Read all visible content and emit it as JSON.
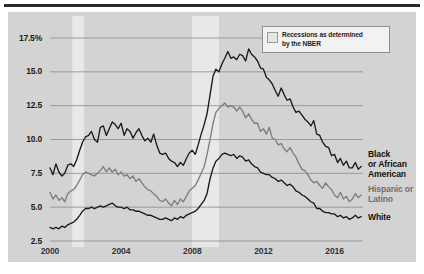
{
  "chart_data": {
    "type": "line",
    "title": "",
    "subtitle": "",
    "xlabel": "",
    "ylabel": "",
    "xlim": [
      2000,
      2017.6
    ],
    "ylim": [
      2.5,
      17.5
    ],
    "grid": true,
    "legend_position": "top-right-inset",
    "y_ticks": [
      "17.5%",
      "15.0",
      "12.5",
      "10.0",
      "7.5",
      "5.0",
      "2.5"
    ],
    "y_tick_values": [
      17.5,
      15.0,
      12.5,
      10.0,
      7.5,
      5.0,
      2.5
    ],
    "x_ticks": [
      "2000",
      "2004",
      "2008",
      "2012",
      "2016"
    ],
    "x_tick_values": [
      2000,
      2004,
      2008,
      2012,
      2016
    ],
    "legend": {
      "swatch_name": "recession-band-swatch",
      "label_line1": "Recessions as determined",
      "label_line2": "by the NBER"
    },
    "shaded_regions": [
      {
        "name": "recession-2001",
        "start": 2001.25,
        "end": 2001.92
      },
      {
        "name": "recession-2008",
        "start": 2007.98,
        "end": 2009.5
      }
    ],
    "colors": {
      "black_or_african_american": "#1a1a1a",
      "hispanic_or_latino": "#7d7d7d",
      "white": "#1a1a1a",
      "background": "#d3d3d3",
      "gridline": "#8a8a8a",
      "recession_band": "#e8e8e8"
    },
    "series": [
      {
        "name": "Black or African American",
        "label_line1": "Black",
        "label_line2": "or African",
        "label_line3": "American",
        "color": "#1a1a1a",
        "x": [
          2000.0,
          2000.17,
          2000.33,
          2000.5,
          2000.67,
          2000.83,
          2001.0,
          2001.17,
          2001.33,
          2001.5,
          2001.67,
          2001.83,
          2002.0,
          2002.17,
          2002.33,
          2002.5,
          2002.67,
          2002.83,
          2003.0,
          2003.17,
          2003.33,
          2003.5,
          2003.67,
          2003.83,
          2004.0,
          2004.17,
          2004.33,
          2004.5,
          2004.67,
          2004.83,
          2005.0,
          2005.17,
          2005.33,
          2005.5,
          2005.67,
          2005.83,
          2006.0,
          2006.17,
          2006.33,
          2006.5,
          2006.67,
          2006.83,
          2007.0,
          2007.17,
          2007.33,
          2007.5,
          2007.67,
          2007.83,
          2008.0,
          2008.17,
          2008.33,
          2008.5,
          2008.67,
          2008.83,
          2009.0,
          2009.17,
          2009.33,
          2009.5,
          2009.67,
          2009.83,
          2010.0,
          2010.17,
          2010.33,
          2010.5,
          2010.67,
          2010.83,
          2011.0,
          2011.17,
          2011.33,
          2011.5,
          2011.67,
          2011.83,
          2012.0,
          2012.17,
          2012.33,
          2012.5,
          2012.67,
          2012.83,
          2013.0,
          2013.17,
          2013.33,
          2013.5,
          2013.67,
          2013.83,
          2014.0,
          2014.17,
          2014.33,
          2014.5,
          2014.67,
          2014.83,
          2015.0,
          2015.17,
          2015.33,
          2015.5,
          2015.67,
          2015.83,
          2016.0,
          2016.17,
          2016.33,
          2016.5,
          2016.67,
          2016.83,
          2017.0,
          2017.17,
          2017.33,
          2017.5
        ],
        "y": [
          7.9,
          7.4,
          8.2,
          7.6,
          7.3,
          7.5,
          8.1,
          8.2,
          8.0,
          8.5,
          9.2,
          9.8,
          10.2,
          10.3,
          10.6,
          10.0,
          9.8,
          10.9,
          11.0,
          10.3,
          10.8,
          11.3,
          11.1,
          10.8,
          11.2,
          10.3,
          10.8,
          10.6,
          10.1,
          10.5,
          10.8,
          10.3,
          9.9,
          10.1,
          9.8,
          10.4,
          9.6,
          9.0,
          8.9,
          9.0,
          8.6,
          8.4,
          8.3,
          8.0,
          8.3,
          8.1,
          8.6,
          9.0,
          9.2,
          8.9,
          9.6,
          10.4,
          11.1,
          11.9,
          13.3,
          14.7,
          15.2,
          15.0,
          15.6,
          16.0,
          16.5,
          16.0,
          16.1,
          15.9,
          16.3,
          16.2,
          15.8,
          16.7,
          16.3,
          16.1,
          15.8,
          15.3,
          15.2,
          14.6,
          14.4,
          14.1,
          13.6,
          13.2,
          13.8,
          13.3,
          12.9,
          13.0,
          12.4,
          12.0,
          12.1,
          11.8,
          11.5,
          11.3,
          11.0,
          11.4,
          10.4,
          10.3,
          9.8,
          9.5,
          9.4,
          8.8,
          8.9,
          8.3,
          8.6,
          8.1,
          8.4,
          7.9,
          7.9,
          8.3,
          7.8,
          8.0
        ]
      },
      {
        "name": "Hispanic or Latino",
        "label_line1": "Hispanic or",
        "label_line2": "Latino",
        "color": "#7d7d7d",
        "x": [
          2000.0,
          2000.17,
          2000.33,
          2000.5,
          2000.67,
          2000.83,
          2001.0,
          2001.17,
          2001.33,
          2001.5,
          2001.67,
          2001.83,
          2002.0,
          2002.17,
          2002.33,
          2002.5,
          2002.67,
          2002.83,
          2003.0,
          2003.17,
          2003.33,
          2003.5,
          2003.67,
          2003.83,
          2004.0,
          2004.17,
          2004.33,
          2004.5,
          2004.67,
          2004.83,
          2005.0,
          2005.17,
          2005.33,
          2005.5,
          2005.67,
          2005.83,
          2006.0,
          2006.17,
          2006.33,
          2006.5,
          2006.67,
          2006.83,
          2007.0,
          2007.17,
          2007.33,
          2007.5,
          2007.67,
          2007.83,
          2008.0,
          2008.17,
          2008.33,
          2008.5,
          2008.67,
          2008.83,
          2009.0,
          2009.17,
          2009.33,
          2009.5,
          2009.67,
          2009.83,
          2010.0,
          2010.17,
          2010.33,
          2010.5,
          2010.67,
          2010.83,
          2011.0,
          2011.17,
          2011.33,
          2011.5,
          2011.67,
          2011.83,
          2012.0,
          2012.17,
          2012.33,
          2012.5,
          2012.67,
          2012.83,
          2013.0,
          2013.17,
          2013.33,
          2013.5,
          2013.67,
          2013.83,
          2014.0,
          2014.17,
          2014.33,
          2014.5,
          2014.67,
          2014.83,
          2015.0,
          2015.17,
          2015.33,
          2015.5,
          2015.67,
          2015.83,
          2016.0,
          2016.17,
          2016.33,
          2016.5,
          2016.67,
          2016.83,
          2017.0,
          2017.17,
          2017.33,
          2017.5
        ],
        "y": [
          6.1,
          5.6,
          5.9,
          5.5,
          5.7,
          5.4,
          6.0,
          6.2,
          6.3,
          6.6,
          7.0,
          7.4,
          7.6,
          7.5,
          7.4,
          7.3,
          7.5,
          7.7,
          8.0,
          7.6,
          7.9,
          7.6,
          7.8,
          7.4,
          7.6,
          7.3,
          7.4,
          7.1,
          7.3,
          6.9,
          7.1,
          6.8,
          6.5,
          6.3,
          6.2,
          6.0,
          5.8,
          5.5,
          5.4,
          5.6,
          5.3,
          5.1,
          5.5,
          5.2,
          5.6,
          5.4,
          5.8,
          6.2,
          6.4,
          6.6,
          7.0,
          7.5,
          8.0,
          8.9,
          10.0,
          11.2,
          12.0,
          12.3,
          12.5,
          12.7,
          12.4,
          12.5,
          12.4,
          12.1,
          12.4,
          12.1,
          11.6,
          11.9,
          11.5,
          11.2,
          11.2,
          10.6,
          10.8,
          10.4,
          10.9,
          10.1,
          10.0,
          9.6,
          9.7,
          9.3,
          9.1,
          9.4,
          9.0,
          8.7,
          8.2,
          7.8,
          7.7,
          7.4,
          7.0,
          6.8,
          6.9,
          6.6,
          6.4,
          6.8,
          6.5,
          6.3,
          5.9,
          5.7,
          6.1,
          5.6,
          5.8,
          5.4,
          5.6,
          6.0,
          5.7,
          5.9
        ]
      },
      {
        "name": "White",
        "label_line1": "White",
        "color": "#1a1a1a",
        "x": [
          2000.0,
          2000.17,
          2000.33,
          2000.5,
          2000.67,
          2000.83,
          2001.0,
          2001.17,
          2001.33,
          2001.5,
          2001.67,
          2001.83,
          2002.0,
          2002.17,
          2002.33,
          2002.5,
          2002.67,
          2002.83,
          2003.0,
          2003.17,
          2003.33,
          2003.5,
          2003.67,
          2003.83,
          2004.0,
          2004.17,
          2004.33,
          2004.5,
          2004.67,
          2004.83,
          2005.0,
          2005.17,
          2005.33,
          2005.5,
          2005.67,
          2005.83,
          2006.0,
          2006.17,
          2006.33,
          2006.5,
          2006.67,
          2006.83,
          2007.0,
          2007.17,
          2007.33,
          2007.5,
          2007.67,
          2007.83,
          2008.0,
          2008.17,
          2008.33,
          2008.5,
          2008.67,
          2008.83,
          2009.0,
          2009.17,
          2009.33,
          2009.5,
          2009.67,
          2009.83,
          2010.0,
          2010.17,
          2010.33,
          2010.5,
          2010.67,
          2010.83,
          2011.0,
          2011.17,
          2011.33,
          2011.5,
          2011.67,
          2011.83,
          2012.0,
          2012.17,
          2012.33,
          2012.5,
          2012.67,
          2012.83,
          2013.0,
          2013.17,
          2013.33,
          2013.5,
          2013.67,
          2013.83,
          2014.0,
          2014.17,
          2014.33,
          2014.5,
          2014.67,
          2014.83,
          2015.0,
          2015.17,
          2015.33,
          2015.5,
          2015.67,
          2015.83,
          2016.0,
          2016.17,
          2016.33,
          2016.5,
          2016.67,
          2016.83,
          2017.0,
          2017.17,
          2017.33,
          2017.5
        ],
        "y": [
          3.5,
          3.4,
          3.5,
          3.4,
          3.6,
          3.5,
          3.7,
          3.8,
          3.9,
          4.1,
          4.4,
          4.7,
          4.9,
          4.9,
          5.0,
          4.9,
          5.0,
          5.1,
          5.0,
          5.1,
          5.2,
          5.3,
          5.1,
          5.0,
          5.0,
          4.9,
          5.0,
          4.8,
          4.8,
          4.7,
          4.7,
          4.6,
          4.5,
          4.4,
          4.4,
          4.3,
          4.2,
          4.1,
          4.1,
          4.2,
          4.1,
          4.0,
          4.2,
          4.1,
          4.3,
          4.2,
          4.4,
          4.5,
          4.6,
          4.7,
          4.9,
          5.2,
          5.5,
          6.0,
          7.1,
          7.9,
          8.4,
          8.6,
          8.9,
          9.0,
          8.9,
          8.8,
          8.9,
          8.6,
          8.8,
          8.7,
          8.4,
          8.5,
          8.2,
          8.0,
          7.9,
          7.6,
          7.5,
          7.4,
          7.4,
          7.2,
          7.1,
          6.9,
          7.0,
          6.8,
          6.6,
          6.7,
          6.5,
          6.2,
          6.1,
          5.9,
          5.8,
          5.6,
          5.4,
          5.3,
          4.9,
          4.9,
          4.7,
          4.6,
          4.6,
          4.5,
          4.5,
          4.3,
          4.4,
          4.2,
          4.3,
          4.1,
          4.2,
          4.4,
          4.2,
          4.3
        ]
      }
    ]
  }
}
